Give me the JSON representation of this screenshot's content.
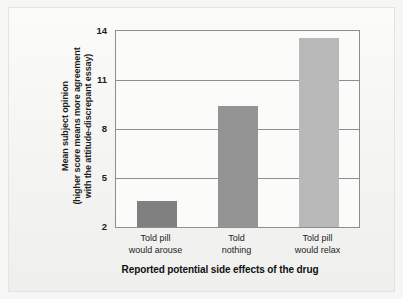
{
  "chart_data": {
    "type": "bar",
    "title": "",
    "subtitle": "",
    "xlabel": "Reported potential side effects of the drug",
    "ylabel_lines": [
      "Mean subject opinion",
      "(higher score means more agreement",
      "with the attitude-discrepant essay)"
    ],
    "ylabel": "Mean subject opinion (higher score means more agreement with the attitude-discrepant essay)",
    "categories": [
      "Told pill would arouse",
      "Told nothing",
      "Told pill would relax"
    ],
    "category_lines": [
      [
        "Told pill",
        "would arouse"
      ],
      [
        "Told",
        "nothing"
      ],
      [
        "Told pill",
        "would relax"
      ]
    ],
    "values": [
      3.6,
      9.4,
      13.6
    ],
    "ylim": [
      2,
      14
    ],
    "yticks": [
      2,
      5,
      8,
      11,
      14
    ],
    "ytick_labels": [
      "2",
      "5",
      "8",
      "11",
      "14"
    ],
    "grid": true,
    "legend": null,
    "bar_colors": [
      "#808080",
      "#949494",
      "#b9b9b9"
    ],
    "plot_background": "#fbfbfa",
    "axis_color": "#8d8d8d",
    "figure_background": "#f4f4f2"
  }
}
